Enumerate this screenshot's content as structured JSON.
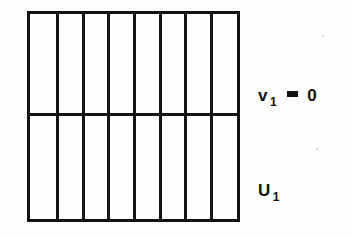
{
  "figure": {
    "type": "domain-partition-diagram",
    "background_color": "#fdfdfb",
    "line_color": "#141414",
    "fill_color": "#fefefc",
    "rectangle": {
      "left": 27,
      "top": 11,
      "width": 213,
      "height": 211,
      "border_width": 3
    },
    "vertical_divider_count": 7,
    "column_count": 8,
    "vertical_divider_positions_pct": [
      12.4,
      25.0,
      37.3,
      49.8,
      62.2,
      74.6,
      87.0
    ],
    "horizontal_divider_count": 1,
    "horizontal_divider_position_pct": 48.5,
    "row_count": 2
  },
  "labels": [
    {
      "id": "label-v",
      "symbol": "v",
      "subscript": "1",
      "relation": "=",
      "value": "0",
      "text": "v₁ = 0",
      "anchor": "interface-line",
      "x": 258,
      "y": 86
    },
    {
      "id": "label-u",
      "symbol": "U",
      "subscript": "1",
      "relation": "",
      "value": "",
      "text": "U₁",
      "anchor": "lower-region",
      "x": 258,
      "y": 181
    }
  ]
}
